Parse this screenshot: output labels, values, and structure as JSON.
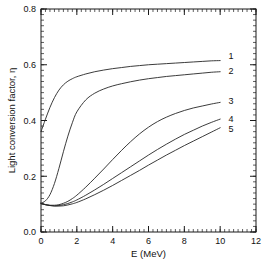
{
  "chart_data": {
    "type": "line",
    "title": "",
    "xlabel": "E (MeV)",
    "ylabel": "Light conversion factor, η",
    "xlim": [
      0,
      12
    ],
    "ylim": [
      0.0,
      0.8
    ],
    "xticks": [
      0,
      2,
      4,
      6,
      8,
      10,
      12
    ],
    "xticklabels": [
      "0",
      "2",
      "4",
      "6",
      "8",
      "10",
      "12"
    ],
    "yticks": [
      0.0,
      0.2,
      0.4,
      0.6,
      0.8
    ],
    "yticklabels": [
      "0.0",
      "0.2",
      "0.4",
      "0.6",
      "0.8"
    ],
    "x_minor_tick_step": 0.25,
    "y_minor_tick_step": 0.02,
    "grid": false,
    "legend_position": "right-inline-curve-labels",
    "line_color": "#262626",
    "background_color": "#ffffff",
    "axis_color": "#1a1a1a",
    "x": [
      0,
      0.25,
      0.5,
      0.75,
      1,
      1.25,
      1.5,
      1.75,
      2,
      2.5,
      3,
      3.5,
      4,
      4.5,
      5,
      5.5,
      6,
      6.5,
      7,
      7.5,
      8,
      8.5,
      9,
      9.5,
      10
    ],
    "series": [
      {
        "name": "1",
        "label": "1",
        "label_x": 10.6,
        "label_y": 0.632,
        "values": [
          0.36,
          0.405,
          0.447,
          0.482,
          0.509,
          0.528,
          0.541,
          0.55,
          0.557,
          0.567,
          0.575,
          0.581,
          0.586,
          0.59,
          0.594,
          0.597,
          0.6,
          0.602,
          0.604,
          0.606,
          0.608,
          0.61,
          0.612,
          0.614,
          0.615
        ]
      },
      {
        "name": "2",
        "label": "2",
        "label_x": 10.6,
        "label_y": 0.578,
        "values": [
          0.103,
          0.112,
          0.134,
          0.174,
          0.228,
          0.288,
          0.344,
          0.392,
          0.431,
          0.474,
          0.498,
          0.513,
          0.524,
          0.532,
          0.539,
          0.545,
          0.55,
          0.554,
          0.558,
          0.561,
          0.564,
          0.567,
          0.57,
          0.573,
          0.575
        ]
      },
      {
        "name": "3",
        "label": "3",
        "label_x": 10.6,
        "label_y": 0.47,
        "values": [
          0.103,
          0.098,
          0.096,
          0.096,
          0.098,
          0.103,
          0.11,
          0.12,
          0.132,
          0.161,
          0.193,
          0.226,
          0.26,
          0.293,
          0.324,
          0.352,
          0.376,
          0.396,
          0.412,
          0.425,
          0.436,
          0.445,
          0.452,
          0.459,
          0.465
        ]
      },
      {
        "name": "4",
        "label": "4",
        "label_x": 10.6,
        "label_y": 0.408,
        "values": [
          0.103,
          0.098,
          0.095,
          0.094,
          0.095,
          0.098,
          0.102,
          0.108,
          0.115,
          0.132,
          0.151,
          0.171,
          0.192,
          0.213,
          0.234,
          0.255,
          0.276,
          0.296,
          0.315,
          0.333,
          0.35,
          0.365,
          0.38,
          0.393,
          0.405
        ]
      },
      {
        "name": "5",
        "label": "5",
        "label_x": 10.6,
        "label_y": 0.372,
        "values": [
          0.103,
          0.098,
          0.095,
          0.093,
          0.093,
          0.094,
          0.097,
          0.101,
          0.106,
          0.119,
          0.134,
          0.15,
          0.167,
          0.185,
          0.203,
          0.221,
          0.24,
          0.258,
          0.276,
          0.293,
          0.31,
          0.326,
          0.342,
          0.358,
          0.374
        ]
      }
    ]
  }
}
